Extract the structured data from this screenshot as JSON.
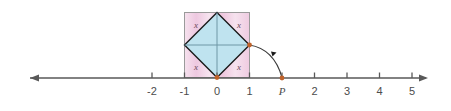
{
  "figure": {
    "axis": {
      "tick_labels": [
        "-2",
        "-1",
        "0",
        "1",
        "2",
        "3",
        "4",
        "5"
      ],
      "tick_values": [
        -2,
        -1,
        0,
        1,
        2,
        3,
        4,
        5
      ],
      "point_label": "P",
      "point_value": 1.4,
      "left_arrow": true,
      "right_arrow": true,
      "color": "#595959"
    },
    "square": {
      "x_from": -1,
      "x_to": 1,
      "y_from": 0,
      "y_to": 2,
      "fill": "#f0cee2",
      "stroke": "#8a8a8a"
    },
    "diamond": {
      "fill": "#bfe3ef",
      "stroke": "#1a1a1a",
      "vertices": [
        "top",
        "right",
        "bottom",
        "left"
      ]
    },
    "corner_labels": [
      {
        "text": "x",
        "corner": "top-left"
      },
      {
        "text": "x",
        "corner": "top-right"
      },
      {
        "text": "x",
        "corner": "bottom-left"
      },
      {
        "text": "x",
        "corner": "bottom-right"
      }
    ],
    "arc": {
      "from": "diamond-right-vertex",
      "to": "point-P",
      "color": "#3a3a3a",
      "arrowhead": true
    },
    "vertex_dots": {
      "color": "#c0622a",
      "positions": [
        "origin",
        "right-vertex",
        "point-P"
      ]
    },
    "colors": {
      "pink": "#f0cee2",
      "blue": "#bfe3ef",
      "axis": "#595959",
      "dot": "#c0622a",
      "diamond_stroke": "#1a1a1a"
    }
  }
}
